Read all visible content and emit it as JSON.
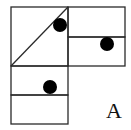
{
  "figure": {
    "label": "A",
    "stroke_color": "#2a2a2a",
    "dot_color": "#000000",
    "background": "#ffffff",
    "cells": [
      {
        "name": "top-left-square",
        "x": 11,
        "y": 7,
        "w": 57,
        "h": 59,
        "diagonal": true
      },
      {
        "name": "top-right-upper",
        "x": 68,
        "y": 7,
        "w": 57,
        "h": 30
      },
      {
        "name": "top-right-lower",
        "x": 68,
        "y": 37,
        "w": 57,
        "h": 29
      },
      {
        "name": "bottom-left-upper",
        "x": 11,
        "y": 66,
        "w": 57,
        "h": 29
      },
      {
        "name": "bottom-left-lower",
        "x": 11,
        "y": 95,
        "w": 57,
        "h": 29
      }
    ],
    "dots": [
      {
        "name": "dot-top-left",
        "cx": 60,
        "cy": 25,
        "r": 7
      },
      {
        "name": "dot-top-right",
        "cx": 107,
        "cy": 44,
        "r": 7
      },
      {
        "name": "dot-bottom-left",
        "cx": 50,
        "cy": 87,
        "r": 7
      }
    ]
  }
}
